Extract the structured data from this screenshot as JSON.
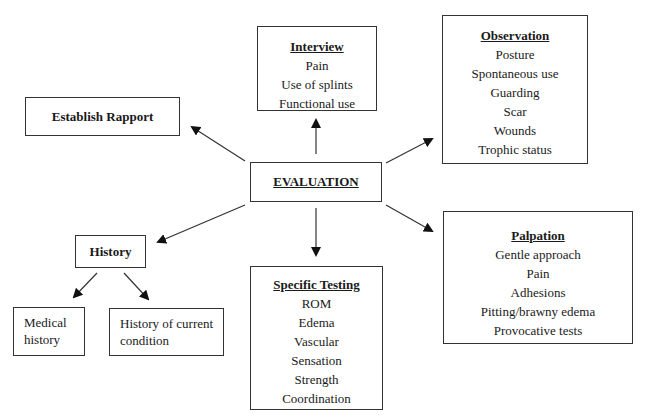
{
  "center": {
    "label": "EVALUATION"
  },
  "establish_rapport": {
    "label": "Establish Rapport"
  },
  "interview": {
    "title": "Interview",
    "items": [
      "Pain",
      "Use of splints",
      "Functional use"
    ]
  },
  "observation": {
    "title": "Observation",
    "items": [
      "Posture",
      "Spontaneous use",
      "Guarding",
      "Scar",
      "Wounds",
      "Trophic status"
    ]
  },
  "history": {
    "label": "History",
    "children": [
      {
        "label": "Medical history"
      },
      {
        "label": "History of current condition"
      }
    ]
  },
  "specific_testing": {
    "title": "Specific Testing",
    "items": [
      "ROM",
      "Edema",
      "Vascular",
      "Sensation",
      "Strength",
      "Coordination"
    ]
  },
  "palpation": {
    "title": "Palpation",
    "items": [
      "Gentle approach",
      "Pain",
      "Adhesions",
      "Pitting/brawny edema",
      "Provocative tests"
    ]
  }
}
